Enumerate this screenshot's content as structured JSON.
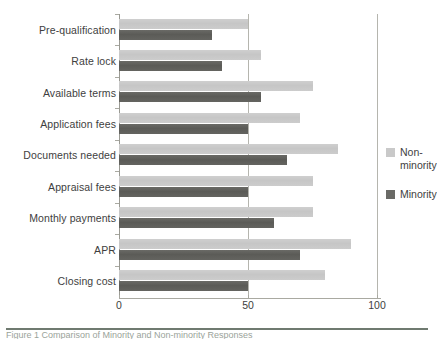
{
  "chart_data": {
    "type": "bar",
    "orientation": "horizontal",
    "title": "",
    "xlabel": "",
    "ylabel": "",
    "xlim": [
      0,
      100
    ],
    "xticks": [
      0,
      50,
      100
    ],
    "xtick_labels": [
      "0",
      "50",
      "100"
    ],
    "grid": true,
    "legend_position": "right",
    "categories": [
      "Pre-qualification",
      "Rate lock",
      "Available terms",
      "Application fees",
      "Documents needed",
      "Appraisal fees",
      "Monthly payments",
      "APR",
      "Closing cost"
    ],
    "series": [
      {
        "name": "Non-\nminority",
        "legend_label": "Non-\nminority",
        "color": "#c8c8c8",
        "values": [
          50,
          55,
          75,
          70,
          85,
          75,
          75,
          90,
          80
        ]
      },
      {
        "name": "Minority",
        "legend_label": "Minority",
        "color": "#5f5f5b",
        "values": [
          36,
          40,
          55,
          50,
          65,
          50,
          60,
          70,
          50
        ]
      }
    ]
  },
  "caption": {
    "text": "Figure 1 Comparison of Minority and Non-minority Responses"
  },
  "colors": {
    "nonminority": "#c8c8c8",
    "minority": "#5f5f5b",
    "axis": "#a9a9a1",
    "grid": "#b5b5ae",
    "text": "#3e3e3e",
    "rule": "#6f7a70",
    "background": "#ffffff"
  }
}
